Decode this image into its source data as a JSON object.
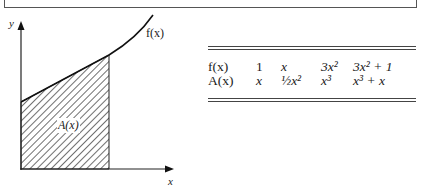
{
  "figure": {
    "axis_y_label": "y",
    "axis_x_label": "x",
    "curve_label": "f(x)",
    "area_label": "A(x)"
  },
  "table": {
    "rows": [
      {
        "head": "f(x)",
        "cells": [
          "1",
          "x",
          "3x²",
          "3x² + 1"
        ]
      },
      {
        "head": "A(x)",
        "cells": [
          "x",
          "½x²",
          "x³",
          "x³ + x"
        ]
      }
    ]
  }
}
